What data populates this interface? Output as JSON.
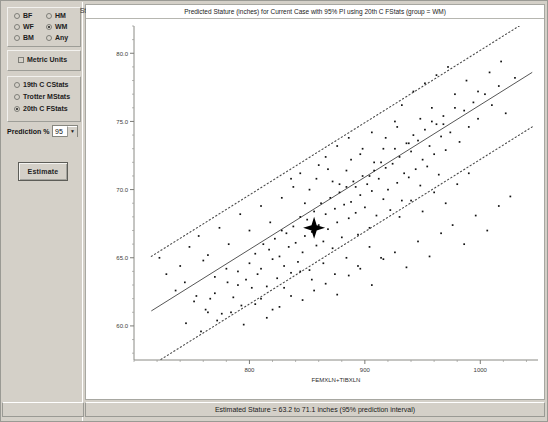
{
  "panel": {
    "sex_group": [
      {
        "label": "BF",
        "selected": false
      },
      {
        "label": "HM",
        "selected": false
      },
      {
        "label": "WF",
        "selected": false
      },
      {
        "label": "WM",
        "selected": true
      },
      {
        "label": "BM",
        "selected": false
      },
      {
        "label": "Any",
        "selected": false
      }
    ],
    "metric_units": {
      "label": "Metric Units",
      "checked": false
    },
    "stats_group": [
      {
        "label": "19th C CStats",
        "selected": false
      },
      {
        "label": "Trotter MStats",
        "selected": false
      },
      {
        "label": "20th C FStats",
        "selected": true
      }
    ],
    "prediction": {
      "label": "Prediction %",
      "value": "95",
      "arrow": "chevron-down-icon"
    },
    "estimate_button": "Estimate"
  },
  "chart_header": {
    "y_axis_corner_label": "Stature",
    "title": "Predicted Stature (inches) for Current Case with 95% PI using 20th C FStats (group = WM)"
  },
  "statusbar": {
    "text": "Estimated Stature = 63.2 to 71.1 inches (95% prediction interval)"
  },
  "chart_data": {
    "type": "scatter",
    "title": "Predicted Stature (inches) for Current Case with 95% PI using 20th C FStats (group = WM)",
    "xlabel": "FEMXLN+TIBXLN",
    "ylabel": "Stature",
    "xlim": [
      700,
      1050
    ],
    "ylim": [
      57.5,
      82.0
    ],
    "xticks": [
      800,
      900,
      1000
    ],
    "xtick_labels": [
      "800",
      "900",
      "1000"
    ],
    "yticks": [
      60.0,
      65.0,
      70.0,
      75.0,
      80.0
    ],
    "ytick_labels": [
      "60.0",
      "65.0",
      "70.0",
      "75.0",
      "80.0"
    ],
    "grid": false,
    "legend": "none",
    "regression": {
      "name": "fit line",
      "x": [
        715,
        1045
      ],
      "y": [
        61.1,
        78.6
      ]
    },
    "prediction_interval": {
      "level": 95,
      "upper": {
        "x": [
          715,
          1045
        ],
        "y": [
          65.1,
          82.6
        ]
      },
      "lower": {
        "x": [
          715,
          1045
        ],
        "y": [
          57.1,
          74.6
        ]
      }
    },
    "current_case": {
      "marker": "star",
      "x": 856,
      "y": 67.2,
      "estimate_low": 63.2,
      "estimate_high": 71.1
    },
    "points": [
      [
        762,
        61.2
      ],
      [
        770,
        62.4
      ],
      [
        776,
        60.9
      ],
      [
        781,
        63.2
      ],
      [
        786,
        62.1
      ],
      [
        790,
        64.0
      ],
      [
        793,
        61.5
      ],
      [
        797,
        63.4
      ],
      [
        800,
        64.6
      ],
      [
        802,
        62.8
      ],
      [
        805,
        65.3
      ],
      [
        807,
        63.8
      ],
      [
        810,
        64.2
      ],
      [
        812,
        66.0
      ],
      [
        815,
        62.9
      ],
      [
        817,
        65.6
      ],
      [
        820,
        64.9
      ],
      [
        822,
        66.4
      ],
      [
        824,
        63.5
      ],
      [
        826,
        65.1
      ],
      [
        828,
        67.0
      ],
      [
        830,
        64.4
      ],
      [
        832,
        66.8
      ],
      [
        834,
        65.8
      ],
      [
        836,
        63.9
      ],
      [
        838,
        67.3
      ],
      [
        840,
        66.1
      ],
      [
        842,
        64.7
      ],
      [
        844,
        68.0
      ],
      [
        846,
        65.4
      ],
      [
        848,
        66.6
      ],
      [
        850,
        67.8
      ],
      [
        852,
        64.1
      ],
      [
        854,
        66.9
      ],
      [
        856,
        68.4
      ],
      [
        858,
        65.9
      ],
      [
        860,
        67.4
      ],
      [
        862,
        69.0
      ],
      [
        864,
        66.2
      ],
      [
        866,
        68.2
      ],
      [
        868,
        67.1
      ],
      [
        870,
        69.4
      ],
      [
        872,
        65.7
      ],
      [
        874,
        68.6
      ],
      [
        876,
        67.6
      ],
      [
        878,
        69.8
      ],
      [
        880,
        66.5
      ],
      [
        882,
        68.9
      ],
      [
        884,
        70.2
      ],
      [
        886,
        67.9
      ],
      [
        888,
        69.1
      ],
      [
        890,
        70.6
      ],
      [
        892,
        68.3
      ],
      [
        894,
        66.7
      ],
      [
        896,
        69.6
      ],
      [
        898,
        71.0
      ],
      [
        900,
        68.7
      ],
      [
        902,
        70.4
      ],
      [
        904,
        67.2
      ],
      [
        906,
        69.9
      ],
      [
        908,
        71.4
      ],
      [
        910,
        68.1
      ],
      [
        912,
        70.8
      ],
      [
        914,
        72.0
      ],
      [
        916,
        69.3
      ],
      [
        918,
        71.6
      ],
      [
        920,
        70.0
      ],
      [
        922,
        68.5
      ],
      [
        924,
        71.9
      ],
      [
        926,
        73.0
      ],
      [
        928,
        70.5
      ],
      [
        930,
        72.4
      ],
      [
        932,
        69.2
      ],
      [
        934,
        71.2
      ],
      [
        936,
        73.4
      ],
      [
        938,
        70.9
      ],
      [
        940,
        72.8
      ],
      [
        942,
        74.0
      ],
      [
        944,
        71.5
      ],
      [
        946,
        73.6
      ],
      [
        948,
        70.3
      ],
      [
        950,
        72.2
      ],
      [
        952,
        74.4
      ],
      [
        954,
        71.7
      ],
      [
        956,
        73.2
      ],
      [
        958,
        75.0
      ],
      [
        960,
        72.6
      ],
      [
        962,
        74.8
      ],
      [
        964,
        71.1
      ],
      [
        966,
        73.9
      ],
      [
        968,
        75.4
      ],
      [
        970,
        72.9
      ],
      [
        974,
        74.2
      ],
      [
        978,
        76.0
      ],
      [
        982,
        73.5
      ],
      [
        986,
        75.8
      ],
      [
        990,
        74.6
      ],
      [
        994,
        76.4
      ],
      [
        998,
        75.2
      ],
      [
        1004,
        77.0
      ],
      [
        1010,
        76.2
      ],
      [
        1016,
        77.6
      ],
      [
        1022,
        75.6
      ],
      [
        1030,
        78.2
      ],
      [
        745,
        60.2
      ],
      [
        752,
        61.8
      ],
      [
        758,
        59.6
      ],
      [
        766,
        62.0
      ],
      [
        772,
        60.4
      ],
      [
        784,
        61.0
      ],
      [
        795,
        60.1
      ],
      [
        805,
        61.6
      ],
      [
        815,
        60.6
      ],
      [
        826,
        61.4
      ],
      [
        836,
        62.2
      ],
      [
        846,
        61.9
      ],
      [
        856,
        62.6
      ],
      [
        866,
        63.1
      ],
      [
        876,
        62.3
      ],
      [
        886,
        63.7
      ],
      [
        896,
        64.2
      ],
      [
        906,
        63.0
      ],
      [
        916,
        64.9
      ],
      [
        926,
        65.4
      ],
      [
        936,
        64.3
      ],
      [
        946,
        66.2
      ],
      [
        956,
        65.1
      ],
      [
        966,
        66.8
      ],
      [
        976,
        67.4
      ],
      [
        986,
        66.0
      ],
      [
        996,
        68.1
      ],
      [
        1006,
        67.0
      ],
      [
        1016,
        68.8
      ],
      [
        1026,
        69.5
      ],
      [
        740,
        64.4
      ],
      [
        748,
        65.8
      ],
      [
        756,
        66.6
      ],
      [
        764,
        65.2
      ],
      [
        774,
        67.2
      ],
      [
        782,
        66.0
      ],
      [
        792,
        68.2
      ],
      [
        800,
        67.0
      ],
      [
        810,
        68.8
      ],
      [
        818,
        67.6
      ],
      [
        828,
        69.4
      ],
      [
        838,
        70.2
      ],
      [
        848,
        69.0
      ],
      [
        858,
        70.8
      ],
      [
        868,
        71.5
      ],
      [
        878,
        70.4
      ],
      [
        888,
        72.2
      ],
      [
        898,
        73.0
      ],
      [
        908,
        72.0
      ],
      [
        918,
        73.8
      ],
      [
        928,
        74.6
      ],
      [
        938,
        73.4
      ],
      [
        948,
        75.2
      ],
      [
        958,
        76.0
      ],
      [
        968,
        74.8
      ],
      [
        978,
        77.0
      ],
      [
        988,
        78.0
      ],
      [
        998,
        77.2
      ],
      [
        1008,
        78.6
      ],
      [
        1018,
        79.4
      ],
      [
        836,
        70.8
      ],
      [
        844,
        71.2
      ],
      [
        852,
        70.0
      ],
      [
        860,
        71.8
      ],
      [
        872,
        70.6
      ],
      [
        884,
        71.4
      ],
      [
        892,
        70.2
      ],
      [
        904,
        71.0
      ],
      [
        844,
        64.0
      ],
      [
        854,
        63.4
      ],
      [
        864,
        64.6
      ],
      [
        874,
        63.8
      ],
      [
        884,
        65.0
      ],
      [
        894,
        64.4
      ],
      [
        904,
        65.8
      ],
      [
        914,
        65.0
      ],
      [
        866,
        72.4
      ],
      [
        876,
        73.2
      ],
      [
        886,
        73.8
      ],
      [
        896,
        72.6
      ],
      [
        906,
        74.2
      ],
      [
        916,
        73.0
      ],
      [
        926,
        75.0
      ],
      [
        810,
        62.0
      ],
      [
        820,
        61.2
      ],
      [
        830,
        62.8
      ],
      [
        790,
        63.0
      ],
      [
        780,
        64.2
      ],
      [
        770,
        63.6
      ],
      [
        760,
        64.8
      ],
      [
        930,
        68.0
      ],
      [
        940,
        69.2
      ],
      [
        950,
        68.4
      ],
      [
        960,
        69.8
      ],
      [
        970,
        69.0
      ],
      [
        980,
        70.4
      ],
      [
        990,
        71.2
      ],
      [
        932,
        76.2
      ],
      [
        942,
        77.2
      ],
      [
        952,
        77.8
      ],
      [
        962,
        78.4
      ],
      [
        972,
        79.0
      ],
      [
        736,
        62.6
      ],
      [
        744,
        63.2
      ],
      [
        754,
        62.2
      ],
      [
        764,
        61.0
      ],
      [
        728,
        63.8
      ],
      [
        722,
        65.0
      ]
    ]
  }
}
